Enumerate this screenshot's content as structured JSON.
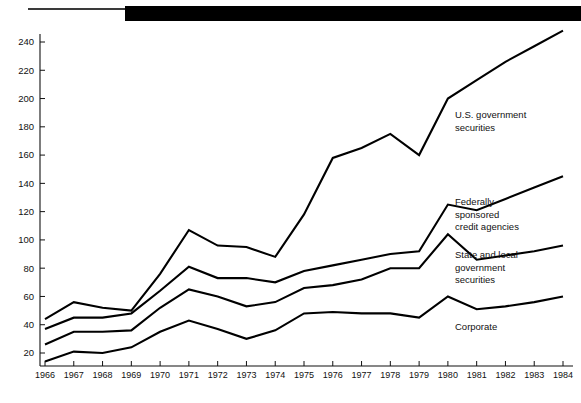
{
  "decor": {
    "thin_rule": "thin-horizontal-rule",
    "thick_bar": "thick-black-header-bar"
  },
  "chart_data": {
    "type": "line",
    "title": "",
    "subtitle": "",
    "xlabel": "",
    "ylabel": "",
    "grid": false,
    "legend_position": "right-inline-labels",
    "xlim": [
      1966,
      1984
    ],
    "ylim": [
      0,
      250
    ],
    "yticks": [
      20,
      40,
      60,
      80,
      100,
      120,
      140,
      160,
      180,
      200,
      220,
      240
    ],
    "ytick_labels": [
      "20",
      "40",
      "60",
      "80",
      "100",
      "120",
      "140",
      "160",
      "180",
      "200",
      "220",
      "240"
    ],
    "x": [
      1966,
      1967,
      1968,
      1969,
      1970,
      1971,
      1972,
      1973,
      1974,
      1975,
      1976,
      1977,
      1978,
      1979,
      1980,
      1981,
      1982,
      1983,
      1984
    ],
    "xtick_labels": [
      "1966",
      "1967",
      "1968",
      "1969",
      "1970",
      "1971",
      "1972",
      "1973",
      "1974",
      "1975",
      "1976",
      "1977",
      "1978",
      "1979",
      "1980",
      "1981",
      "1982",
      "1983",
      "1984"
    ],
    "series": [
      {
        "name": "U.S. government securities",
        "label_lines": [
          "U.S. government",
          "securities"
        ],
        "color": "#000000",
        "values": [
          44,
          56,
          52,
          50,
          76,
          107,
          96,
          95,
          88,
          118,
          158,
          165,
          175,
          160,
          200,
          213,
          226,
          237,
          248
        ]
      },
      {
        "name": "Federally sponsored credit agencies",
        "label_lines": [
          "Federally",
          "sponsored",
          "credit agencies"
        ],
        "color": "#000000",
        "values": [
          37,
          45,
          45,
          48,
          64,
          81,
          73,
          73,
          70,
          78,
          82,
          86,
          90,
          92,
          125,
          121,
          129,
          137,
          145
        ]
      },
      {
        "name": "State and local government securities",
        "label_lines": [
          "State and local",
          "government",
          "securities"
        ],
        "color": "#000000",
        "values": [
          26,
          35,
          35,
          36,
          52,
          65,
          60,
          53,
          56,
          66,
          68,
          72,
          80,
          80,
          104,
          86,
          89,
          92,
          96
        ]
      },
      {
        "name": "Corporate",
        "label_lines": [
          "Corporate"
        ],
        "color": "#000000",
        "values": [
          14,
          21,
          20,
          24,
          35,
          43,
          37,
          30,
          36,
          48,
          49,
          48,
          48,
          45,
          60,
          51,
          53,
          56,
          60
        ]
      }
    ],
    "series_label_anchors": [
      {
        "x": 455,
        "y": 118
      },
      {
        "x": 455,
        "y": 205
      },
      {
        "x": 455,
        "y": 258
      },
      {
        "x": 455,
        "y": 330
      }
    ]
  }
}
